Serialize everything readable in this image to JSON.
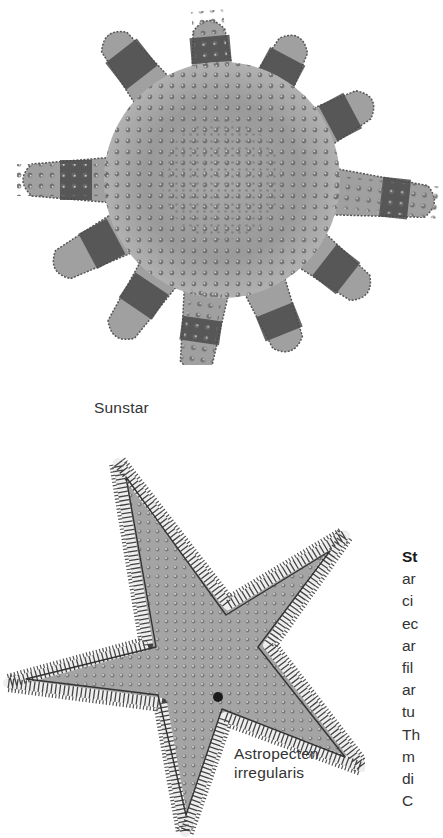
{
  "page": {
    "figures": [
      {
        "id": "sunstar",
        "caption": "Sunstar",
        "description": "Engraved illustration of a many-armed sunstar with banded dark arms and tuberculate disc",
        "arm_count": 11
      },
      {
        "id": "astropecten",
        "caption_lines": [
          "Astropecten",
          "irregularis"
        ],
        "description": "Engraved illustration of a five-armed starfish with fringed marginal plates",
        "arm_count": 5
      }
    ],
    "right_column": {
      "heading_fragment": "St",
      "line_fragments": [
        "ar",
        "ci",
        "ec",
        "ar",
        "fil",
        "ar",
        "tu",
        "Th",
        "m",
        "di",
        "C"
      ]
    },
    "colors": {
      "background": "#ffffff",
      "body_gray": "#9a9a9a",
      "band_dark": "#4a4a4a",
      "text": "#333333"
    }
  }
}
